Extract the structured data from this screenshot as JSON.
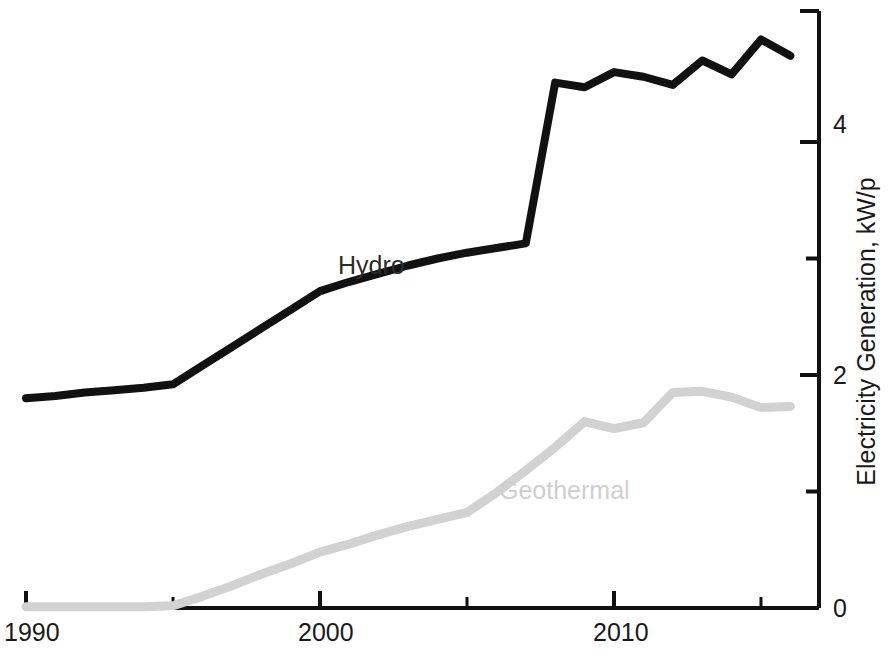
{
  "chart_data": {
    "type": "line",
    "title": "",
    "subtitle": "",
    "xlabel": "",
    "ylabel": "Electricity Generation, kW/p",
    "xlim": [
      1990,
      2017
    ],
    "ylim": [
      0,
      5.12
    ],
    "grid": false,
    "legend": "inline-labels",
    "x_ticks_major": [
      1990,
      2000,
      2010
    ],
    "x_ticks_major_labels": [
      "1990",
      "2000",
      "2010"
    ],
    "x_ticks_minor": [
      1995,
      2005,
      2015
    ],
    "y_ticks_major": [
      0,
      2,
      4
    ],
    "y_ticks_major_labels": [
      "0",
      "2",
      "4"
    ],
    "y_ticks_minor": [
      1,
      3
    ],
    "y_axis_side": "right",
    "x": [
      1990,
      1991,
      1992,
      1993,
      1994,
      1995,
      1996,
      1997,
      1998,
      1999,
      2000,
      2001,
      2002,
      2003,
      2004,
      2005,
      2006,
      2007,
      2008,
      2009,
      2010,
      2011,
      2012,
      2013,
      2014,
      2015,
      2016
    ],
    "series": [
      {
        "name": "Hydro",
        "color": "#111111",
        "label_position": "above-line",
        "values": [
          1.8,
          1.82,
          1.85,
          1.87,
          1.89,
          1.92,
          2.08,
          2.24,
          2.4,
          2.56,
          2.72,
          2.8,
          2.87,
          2.94,
          3.0,
          3.05,
          3.09,
          3.13,
          4.51,
          4.47,
          4.6,
          4.56,
          4.49,
          4.7,
          4.58,
          4.88,
          4.74
        ]
      },
      {
        "name": "Geothermal",
        "color": "#d2d2d2",
        "label_position": "below-line",
        "values": [
          0.01,
          0.01,
          0.01,
          0.01,
          0.01,
          0.02,
          0.1,
          0.19,
          0.29,
          0.38,
          0.48,
          0.55,
          0.63,
          0.7,
          0.76,
          0.82,
          0.99,
          1.18,
          1.38,
          1.6,
          1.54,
          1.59,
          1.85,
          1.86,
          1.81,
          1.72,
          1.73
        ]
      }
    ]
  },
  "axes": {
    "y_title": "Electricity Generation, kW/p",
    "y_tick_0": "0",
    "y_tick_2": "2",
    "y_tick_4": "4",
    "x_tick_1990": "1990",
    "x_tick_2000": "2000",
    "x_tick_2010": "2010"
  },
  "labels": {
    "hydro": "Hydro",
    "geothermal": "Geothermal"
  }
}
